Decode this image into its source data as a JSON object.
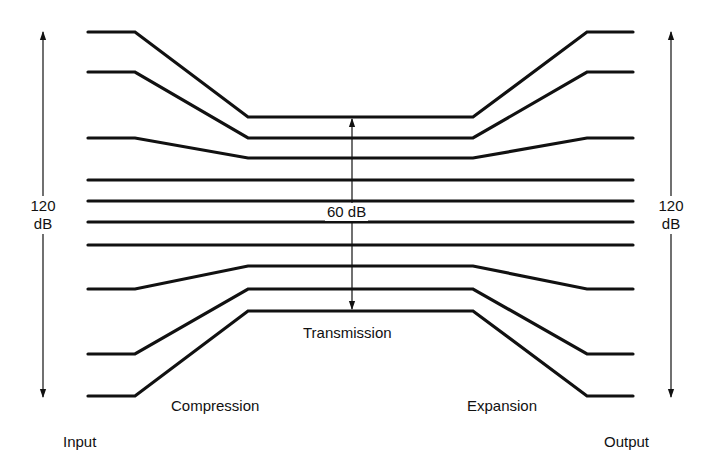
{
  "diagram": {
    "labels": {
      "input": "Input",
      "output": "Output",
      "compression": "Compression",
      "expansion": "Expansion",
      "transmission": "Transmission",
      "left_range_value": "120",
      "left_range_unit": "dB",
      "right_range_value": "120",
      "right_range_unit": "dB",
      "middle_range": "60 dB"
    },
    "stroke_color": "#111111",
    "background": "#ffffff",
    "x_points": {
      "left_start": 88,
      "left_break": 135,
      "center_start": 248,
      "center_end": 473,
      "right_break": 587,
      "right_end": 633
    },
    "levels": [
      {
        "outer_y": 32,
        "center_y": 117
      },
      {
        "outer_y": 72,
        "center_y": 138
      },
      {
        "outer_y": 138,
        "center_y": 158
      },
      {
        "outer_y": 180,
        "center_y": 180
      },
      {
        "outer_y": 201,
        "center_y": 201
      },
      {
        "outer_y": 222,
        "center_y": 222
      },
      {
        "outer_y": 245,
        "center_y": 245
      },
      {
        "outer_y": 289,
        "center_y": 266
      },
      {
        "outer_y": 354,
        "center_y": 289
      },
      {
        "outer_y": 396,
        "center_y": 311
      }
    ],
    "arrows": {
      "left": {
        "x": 43,
        "y1": 32,
        "y2": 397
      },
      "right": {
        "x": 671,
        "y1": 32,
        "y2": 397
      },
      "middle": {
        "x": 352,
        "y1": 119,
        "y2": 309
      }
    }
  }
}
